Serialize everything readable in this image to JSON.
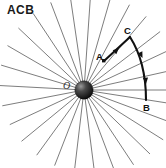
{
  "figure": {
    "title": "ACB",
    "background_color": "#ffffff",
    "ray_color": "#6e6e6e",
    "path_color": "#111111",
    "center_body_color": "#1a1a1a",
    "labels": {
      "origin": "O",
      "point_a": "A",
      "point_c": "C",
      "point_b": "B"
    },
    "geometry": {
      "center": {
        "x": 84,
        "y": 90
      },
      "body_radius": 9,
      "ray_count": 28,
      "ray_length": 95,
      "point_a": {
        "x": 104,
        "y": 61
      },
      "point_c": {
        "x": 130,
        "y": 37
      },
      "point_b": {
        "x": 146,
        "y": 100
      },
      "curve_control": {
        "x": 146,
        "y": 62
      }
    },
    "arrowheads": [
      {
        "name": "arrow-on-segment-ac",
        "x": 119,
        "y": 48,
        "angle": -43
      },
      {
        "name": "arrow-on-curve-upper",
        "x": 142,
        "y": 57,
        "angle": 62
      },
      {
        "name": "arrow-on-curve-lower",
        "x": 146,
        "y": 83,
        "angle": 80
      }
    ]
  }
}
